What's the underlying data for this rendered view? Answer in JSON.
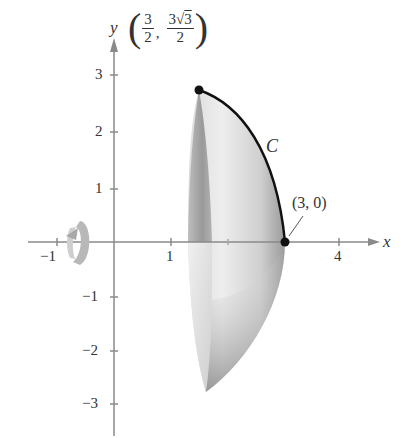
{
  "figure": {
    "axes": {
      "x_label": "x",
      "y_label": "y",
      "x_ticks": [
        {
          "value": -1,
          "label": "−1"
        },
        {
          "value": 1,
          "label": "1"
        },
        {
          "value": 4,
          "label": "4"
        }
      ],
      "y_ticks": [
        {
          "value": 3,
          "label": "3"
        },
        {
          "value": 2,
          "label": "2"
        },
        {
          "value": 1,
          "label": "1"
        },
        {
          "value": -1,
          "label": "−1"
        },
        {
          "value": -2,
          "label": "−2"
        },
        {
          "value": -3,
          "label": "−3"
        }
      ]
    },
    "curve_label": "C",
    "top_point": {
      "x_num": "3",
      "x_den": "2",
      "y_num_coef": "3",
      "y_num_root": "3",
      "y_den": "2",
      "separator": ","
    },
    "end_point_label": "(3, 0)",
    "rotation_icon": "rotation-arrow-icon",
    "colors": {
      "axis": "#8a8a8a",
      "curve": "#111111",
      "surface_light": "#e4e4e4",
      "surface_dark": "#6a6a6a",
      "point": "#111111"
    }
  }
}
